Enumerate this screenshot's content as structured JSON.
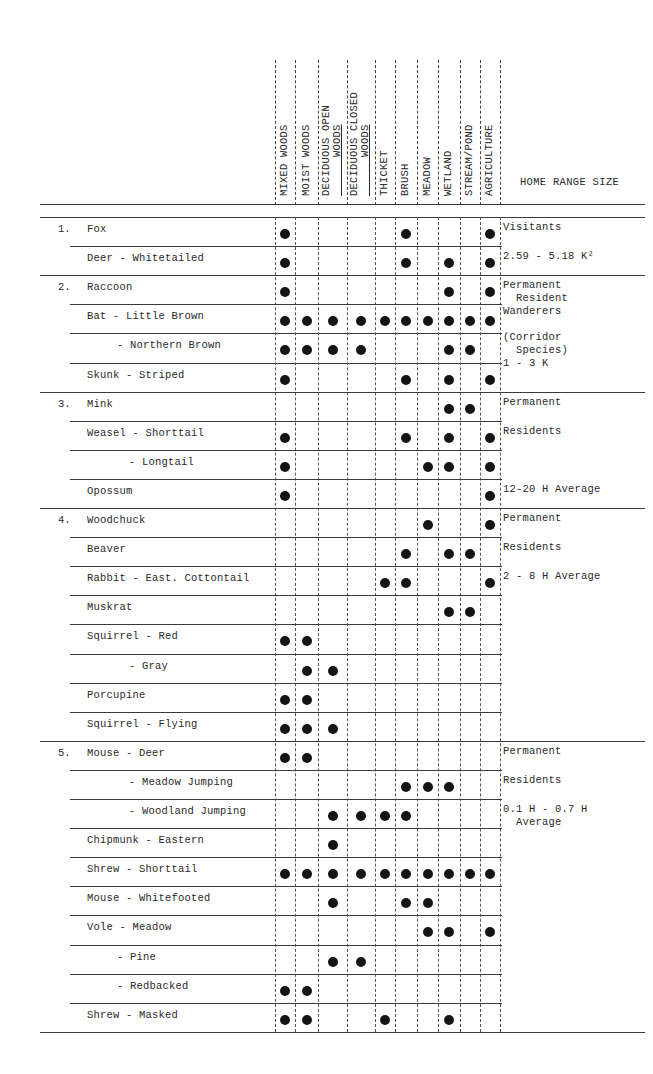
{
  "table": {
    "habitat_columns": [
      "MIXED WOODS",
      "MOIST WOODS",
      "DECIDUOUS OPEN WOODS",
      "DECIDUOUS CLOSED WOODS",
      "THICKET",
      "BRUSH",
      "MEADOW",
      "WETLAND",
      "STREAM/POND",
      "AGRICULTURE"
    ],
    "home_range_header": "HOME RANGE SIZE",
    "groups": [
      {
        "number": "1.",
        "rows": [
          {
            "name": "Fox",
            "indent": 0,
            "habitats": [
              1,
              0,
              0,
              0,
              0,
              1,
              0,
              0,
              0,
              1
            ]
          },
          {
            "name": "Deer - Whitetailed",
            "indent": 0,
            "habitats": [
              1,
              0,
              0,
              0,
              0,
              1,
              0,
              1,
              0,
              1
            ]
          }
        ],
        "home_range": [
          "Visitants",
          "2.59 - 5.18 K²"
        ]
      },
      {
        "number": "2.",
        "rows": [
          {
            "name": "Raccoon",
            "indent": 0,
            "habitats": [
              1,
              0,
              0,
              0,
              0,
              0,
              0,
              1,
              0,
              1
            ]
          },
          {
            "name": "Bat - Little Brown",
            "indent": 0,
            "habitats": [
              1,
              1,
              1,
              1,
              1,
              1,
              1,
              1,
              1,
              1
            ]
          },
          {
            "name": "- Northern Brown",
            "indent": 1,
            "habitats": [
              1,
              1,
              1,
              1,
              0,
              0,
              0,
              1,
              1,
              0
            ]
          },
          {
            "name": "Skunk - Striped",
            "indent": 0,
            "habitats": [
              1,
              0,
              0,
              0,
              0,
              1,
              0,
              1,
              0,
              1
            ]
          }
        ],
        "home_range": [
          "Permanent",
          "  Resident",
          "Wanderers",
          "",
          "(Corridor",
          "  Species)",
          "1 - 3 K"
        ]
      },
      {
        "number": "3.",
        "rows": [
          {
            "name": "Mink",
            "indent": 0,
            "habitats": [
              0,
              0,
              0,
              0,
              0,
              0,
              0,
              1,
              1,
              0
            ]
          },
          {
            "name": "Weasel - Shorttail",
            "indent": 0,
            "habitats": [
              1,
              0,
              0,
              0,
              0,
              1,
              0,
              1,
              0,
              1
            ]
          },
          {
            "name": "- Longtail",
            "indent": 2,
            "habitats": [
              1,
              0,
              0,
              0,
              0,
              0,
              1,
              1,
              0,
              1
            ]
          },
          {
            "name": "Opossum",
            "indent": 0,
            "habitats": [
              1,
              0,
              0,
              0,
              0,
              0,
              0,
              0,
              0,
              1
            ]
          }
        ],
        "home_range": [
          "Permanent",
          "Residents",
          "12-20 H Average"
        ]
      },
      {
        "number": "4.",
        "rows": [
          {
            "name": "Woodchuck",
            "indent": 0,
            "habitats": [
              0,
              0,
              0,
              0,
              0,
              0,
              1,
              0,
              0,
              1
            ]
          },
          {
            "name": "Beaver",
            "indent": 0,
            "habitats": [
              0,
              0,
              0,
              0,
              0,
              1,
              0,
              1,
              1,
              0
            ]
          },
          {
            "name": "Rabbit - East. Cottontail",
            "indent": 0,
            "habitats": [
              0,
              0,
              0,
              0,
              1,
              1,
              0,
              0,
              0,
              1
            ]
          },
          {
            "name": "Muskrat",
            "indent": 0,
            "habitats": [
              0,
              0,
              0,
              0,
              0,
              0,
              0,
              1,
              1,
              0
            ]
          },
          {
            "name": "Squirrel - Red",
            "indent": 0,
            "habitats": [
              1,
              1,
              0,
              0,
              0,
              0,
              0,
              0,
              0,
              0
            ]
          },
          {
            "name": "- Gray",
            "indent": 2,
            "habitats": [
              0,
              1,
              1,
              0,
              0,
              0,
              0,
              0,
              0,
              0
            ]
          },
          {
            "name": "Porcupine",
            "indent": 0,
            "habitats": [
              1,
              1,
              0,
              0,
              0,
              0,
              0,
              0,
              0,
              0
            ]
          },
          {
            "name": "Squirrel - Flying",
            "indent": 0,
            "habitats": [
              1,
              1,
              1,
              0,
              0,
              0,
              0,
              0,
              0,
              0
            ]
          }
        ],
        "home_range": [
          "Permanent",
          "Residents",
          "2 - 8 H Average"
        ]
      },
      {
        "number": "5.",
        "rows": [
          {
            "name": "Mouse - Deer",
            "indent": 0,
            "habitats": [
              1,
              1,
              0,
              0,
              0,
              0,
              0,
              0,
              0,
              0
            ]
          },
          {
            "name": "- Meadow Jumping",
            "indent": 2,
            "habitats": [
              0,
              0,
              0,
              0,
              0,
              1,
              1,
              1,
              0,
              0
            ]
          },
          {
            "name": "- Woodland Jumping",
            "indent": 2,
            "habitats": [
              0,
              0,
              1,
              1,
              1,
              1,
              0,
              0,
              0,
              0
            ]
          },
          {
            "name": "Chipmunk - Eastern",
            "indent": 0,
            "habitats": [
              0,
              0,
              1,
              0,
              0,
              0,
              0,
              0,
              0,
              0
            ]
          },
          {
            "name": "Shrew - Shorttail",
            "indent": 0,
            "habitats": [
              1,
              1,
              1,
              1,
              1,
              1,
              1,
              1,
              1,
              1
            ]
          },
          {
            "name": "Mouse - Whitefooted",
            "indent": 0,
            "habitats": [
              0,
              0,
              1,
              0,
              0,
              1,
              1,
              0,
              0,
              0
            ]
          },
          {
            "name": "Vole - Meadow",
            "indent": 0,
            "habitats": [
              0,
              0,
              0,
              0,
              0,
              0,
              1,
              1,
              0,
              1
            ]
          },
          {
            "name": "- Pine",
            "indent": 1,
            "habitats": [
              0,
              0,
              1,
              1,
              0,
              0,
              0,
              0,
              0,
              0
            ]
          },
          {
            "name": "- Redbacked",
            "indent": 1,
            "habitats": [
              1,
              1,
              0,
              0,
              0,
              0,
              0,
              0,
              0,
              0
            ]
          },
          {
            "name": "Shrew - Masked",
            "indent": 0,
            "habitats": [
              1,
              1,
              0,
              0,
              1,
              0,
              0,
              1,
              0,
              0
            ]
          }
        ],
        "home_range": [
          "Permanent",
          "Residents",
          "0.1 H - 0.7 H",
          "  Average"
        ]
      }
    ]
  },
  "colors": {
    "ink": "#2a2a2a",
    "dot": "#141414",
    "background": "#ffffff"
  }
}
